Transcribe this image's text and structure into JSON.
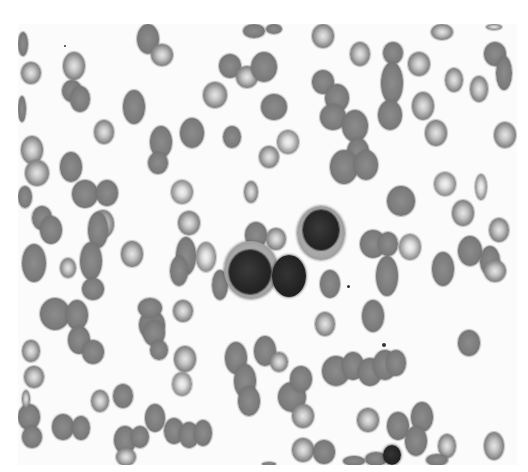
{
  "image": {
    "description": "Grayscale micrograph of a peripheral blood smear showing numerous red blood cells and a cluster of three nucleated white cells in the center",
    "field": {
      "x": 18,
      "y": 24,
      "width": 499,
      "height": 441
    },
    "colors": {
      "background": "#fbfbfb",
      "rbc": "#7c7c7c",
      "nucleus": "#222222"
    }
  },
  "cells": [
    {
      "type": "rbc-dense",
      "x": 18,
      "y": 32,
      "w": 10,
      "h": 24
    },
    {
      "type": "rbc",
      "x": 21,
      "y": 62,
      "w": 20,
      "h": 22
    },
    {
      "type": "rbc",
      "x": 63,
      "y": 52,
      "w": 22,
      "h": 28
    },
    {
      "type": "rbc-dense",
      "x": 62,
      "y": 80,
      "w": 20,
      "h": 22
    },
    {
      "type": "rbc-dense",
      "x": 70,
      "y": 86,
      "w": 20,
      "h": 26
    },
    {
      "type": "rbc-dense",
      "x": 18,
      "y": 96,
      "w": 8,
      "h": 26
    },
    {
      "type": "rbc-dense",
      "x": 123,
      "y": 90,
      "w": 22,
      "h": 34
    },
    {
      "type": "rbc",
      "x": 94,
      "y": 120,
      "w": 20,
      "h": 24
    },
    {
      "type": "rbc-dense",
      "x": 137,
      "y": 24,
      "w": 22,
      "h": 30
    },
    {
      "type": "rbc",
      "x": 151,
      "y": 44,
      "w": 22,
      "h": 22
    },
    {
      "type": "rbc",
      "x": 203,
      "y": 82,
      "w": 24,
      "h": 26
    },
    {
      "type": "rbc-dense",
      "x": 219,
      "y": 54,
      "w": 22,
      "h": 24
    },
    {
      "type": "rbc",
      "x": 236,
      "y": 66,
      "w": 22,
      "h": 22
    },
    {
      "type": "rbc-dense",
      "x": 251,
      "y": 52,
      "w": 26,
      "h": 30
    },
    {
      "type": "rbc-dense",
      "x": 261,
      "y": 94,
      "w": 26,
      "h": 26
    },
    {
      "type": "rbc-dense",
      "x": 243,
      "y": 24,
      "w": 22,
      "h": 14
    },
    {
      "type": "rbc-dense",
      "x": 266,
      "y": 24,
      "w": 16,
      "h": 10
    },
    {
      "type": "rbc-dense",
      "x": 223,
      "y": 126,
      "w": 18,
      "h": 22
    },
    {
      "type": "rbc-pale",
      "x": 277,
      "y": 130,
      "w": 22,
      "h": 24
    },
    {
      "type": "rbc",
      "x": 259,
      "y": 146,
      "w": 20,
      "h": 22
    },
    {
      "type": "rbc-dense",
      "x": 150,
      "y": 126,
      "w": 22,
      "h": 32
    },
    {
      "type": "rbc-dense",
      "x": 180,
      "y": 118,
      "w": 24,
      "h": 30
    },
    {
      "type": "rbc-dense",
      "x": 148,
      "y": 152,
      "w": 20,
      "h": 22
    },
    {
      "type": "rbc",
      "x": 312,
      "y": 24,
      "w": 22,
      "h": 24
    },
    {
      "type": "rbc",
      "x": 350,
      "y": 42,
      "w": 20,
      "h": 24
    },
    {
      "type": "rbc-dense",
      "x": 383,
      "y": 42,
      "w": 20,
      "h": 22
    },
    {
      "type": "rbc",
      "x": 408,
      "y": 52,
      "w": 22,
      "h": 24
    },
    {
      "type": "rbc-dense",
      "x": 381,
      "y": 62,
      "w": 22,
      "h": 42
    },
    {
      "type": "rbc-dense",
      "x": 378,
      "y": 100,
      "w": 24,
      "h": 30
    },
    {
      "type": "rbc",
      "x": 412,
      "y": 92,
      "w": 22,
      "h": 28
    },
    {
      "type": "rbc",
      "x": 425,
      "y": 120,
      "w": 22,
      "h": 26
    },
    {
      "type": "rbc-dense",
      "x": 312,
      "y": 70,
      "w": 22,
      "h": 24
    },
    {
      "type": "rbc-dense",
      "x": 325,
      "y": 84,
      "w": 24,
      "h": 28
    },
    {
      "type": "rbc-dense",
      "x": 320,
      "y": 104,
      "w": 26,
      "h": 26
    },
    {
      "type": "rbc-dense",
      "x": 342,
      "y": 110,
      "w": 26,
      "h": 32
    },
    {
      "type": "rbc-dense",
      "x": 347,
      "y": 138,
      "w": 22,
      "h": 28
    },
    {
      "type": "rbc-dense",
      "x": 330,
      "y": 150,
      "w": 28,
      "h": 34
    },
    {
      "type": "rbc-dense",
      "x": 354,
      "y": 150,
      "w": 24,
      "h": 30
    },
    {
      "type": "rbc",
      "x": 445,
      "y": 68,
      "w": 18,
      "h": 24
    },
    {
      "type": "rbc-dense",
      "x": 484,
      "y": 42,
      "w": 22,
      "h": 24
    },
    {
      "type": "rbc-dense",
      "x": 496,
      "y": 56,
      "w": 16,
      "h": 34
    },
    {
      "type": "rbc",
      "x": 470,
      "y": 76,
      "w": 18,
      "h": 26
    },
    {
      "type": "rbc",
      "x": 494,
      "y": 122,
      "w": 22,
      "h": 26
    },
    {
      "type": "rbc",
      "x": 431,
      "y": 24,
      "w": 22,
      "h": 16
    },
    {
      "type": "rbc",
      "x": 486,
      "y": 24,
      "w": 16,
      "h": 6
    },
    {
      "type": "rbc",
      "x": 21,
      "y": 136,
      "w": 22,
      "h": 28
    },
    {
      "type": "rbc",
      "x": 25,
      "y": 160,
      "w": 24,
      "h": 26
    },
    {
      "type": "rbc-dense",
      "x": 60,
      "y": 152,
      "w": 22,
      "h": 30
    },
    {
      "type": "rbc-dense",
      "x": 72,
      "y": 180,
      "w": 26,
      "h": 28
    },
    {
      "type": "rbc-dense",
      "x": 96,
      "y": 180,
      "w": 22,
      "h": 26
    },
    {
      "type": "rbc",
      "x": 92,
      "y": 210,
      "w": 22,
      "h": 28
    },
    {
      "type": "rbc-dense",
      "x": 18,
      "y": 186,
      "w": 14,
      "h": 22
    },
    {
      "type": "rbc-dense",
      "x": 32,
      "y": 206,
      "w": 20,
      "h": 24
    },
    {
      "type": "rbc-dense",
      "x": 40,
      "y": 216,
      "w": 22,
      "h": 28
    },
    {
      "type": "rbc-dense",
      "x": 22,
      "y": 244,
      "w": 24,
      "h": 38
    },
    {
      "type": "rbc-dense",
      "x": 88,
      "y": 212,
      "w": 20,
      "h": 36
    },
    {
      "type": "rbc",
      "x": 60,
      "y": 258,
      "w": 16,
      "h": 20
    },
    {
      "type": "rbc-dense",
      "x": 80,
      "y": 242,
      "w": 22,
      "h": 38
    },
    {
      "type": "rbc-dense",
      "x": 82,
      "y": 278,
      "w": 22,
      "h": 22
    },
    {
      "type": "rbc",
      "x": 121,
      "y": 241,
      "w": 22,
      "h": 26
    },
    {
      "type": "rbc-pale",
      "x": 171,
      "y": 180,
      "w": 22,
      "h": 24
    },
    {
      "type": "rbc",
      "x": 178,
      "y": 211,
      "w": 22,
      "h": 24
    },
    {
      "type": "rbc-dense",
      "x": 176,
      "y": 237,
      "w": 20,
      "h": 38
    },
    {
      "type": "rbc-dense",
      "x": 170,
      "y": 256,
      "w": 18,
      "h": 30
    },
    {
      "type": "rbc-pale",
      "x": 196,
      "y": 242,
      "w": 20,
      "h": 30
    },
    {
      "type": "rbc",
      "x": 244,
      "y": 181,
      "w": 14,
      "h": 22
    },
    {
      "type": "rbc-dense",
      "x": 245,
      "y": 222,
      "w": 22,
      "h": 26
    },
    {
      "type": "rbc-dense",
      "x": 212,
      "y": 270,
      "w": 16,
      "h": 30
    },
    {
      "type": "rbc",
      "x": 266,
      "y": 228,
      "w": 20,
      "h": 22
    },
    {
      "type": "rbc-dense",
      "x": 320,
      "y": 270,
      "w": 20,
      "h": 28
    },
    {
      "type": "rbc-dense",
      "x": 387,
      "y": 186,
      "w": 28,
      "h": 30
    },
    {
      "type": "rbc-dense",
      "x": 360,
      "y": 230,
      "w": 26,
      "h": 28
    },
    {
      "type": "rbc-dense",
      "x": 378,
      "y": 232,
      "w": 20,
      "h": 24
    },
    {
      "type": "rbc-pale",
      "x": 399,
      "y": 234,
      "w": 22,
      "h": 26
    },
    {
      "type": "rbc-dense",
      "x": 376,
      "y": 256,
      "w": 22,
      "h": 40
    },
    {
      "type": "rbc-pale",
      "x": 434,
      "y": 172,
      "w": 22,
      "h": 24
    },
    {
      "type": "rbc-pale",
      "x": 475,
      "y": 174,
      "w": 12,
      "h": 26
    },
    {
      "type": "rbc",
      "x": 452,
      "y": 200,
      "w": 22,
      "h": 26
    },
    {
      "type": "rbc",
      "x": 489,
      "y": 218,
      "w": 20,
      "h": 24
    },
    {
      "type": "rbc-dense",
      "x": 458,
      "y": 236,
      "w": 24,
      "h": 30
    },
    {
      "type": "rbc-dense",
      "x": 432,
      "y": 252,
      "w": 22,
      "h": 34
    },
    {
      "type": "rbc-dense",
      "x": 480,
      "y": 246,
      "w": 20,
      "h": 30
    },
    {
      "type": "rbc",
      "x": 484,
      "y": 260,
      "w": 22,
      "h": 22
    },
    {
      "type": "rbc-dense",
      "x": 362,
      "y": 300,
      "w": 22,
      "h": 32
    },
    {
      "type": "rbc-dense",
      "x": 458,
      "y": 330,
      "w": 22,
      "h": 26
    },
    {
      "type": "rbc-dense",
      "x": 40,
      "y": 298,
      "w": 30,
      "h": 32
    },
    {
      "type": "rbc-dense",
      "x": 66,
      "y": 300,
      "w": 22,
      "h": 30
    },
    {
      "type": "rbc-dense",
      "x": 68,
      "y": 326,
      "w": 22,
      "h": 28
    },
    {
      "type": "rbc-dense",
      "x": 82,
      "y": 340,
      "w": 22,
      "h": 24
    },
    {
      "type": "rbc",
      "x": 22,
      "y": 340,
      "w": 18,
      "h": 22
    },
    {
      "type": "rbc",
      "x": 24,
      "y": 366,
      "w": 20,
      "h": 22
    },
    {
      "type": "rbc-dense",
      "x": 18,
      "y": 404,
      "w": 22,
      "h": 26
    },
    {
      "type": "rbc-dense",
      "x": 22,
      "y": 426,
      "w": 20,
      "h": 22
    },
    {
      "type": "rbc",
      "x": 91,
      "y": 390,
      "w": 18,
      "h": 22
    },
    {
      "type": "rbc-dense",
      "x": 113,
      "y": 384,
      "w": 20,
      "h": 24
    },
    {
      "type": "rbc-dense",
      "x": 52,
      "y": 414,
      "w": 22,
      "h": 26
    },
    {
      "type": "rbc-dense",
      "x": 72,
      "y": 416,
      "w": 18,
      "h": 24
    },
    {
      "type": "rbc-dense",
      "x": 114,
      "y": 426,
      "w": 22,
      "h": 28
    },
    {
      "type": "rbc-dense",
      "x": 131,
      "y": 426,
      "w": 18,
      "h": 22
    },
    {
      "type": "rbc",
      "x": 116,
      "y": 448,
      "w": 20,
      "h": 18
    },
    {
      "type": "rbc-dense",
      "x": 145,
      "y": 404,
      "w": 20,
      "h": 28
    },
    {
      "type": "rbc-dense",
      "x": 164,
      "y": 418,
      "w": 20,
      "h": 26
    },
    {
      "type": "rbc-dense",
      "x": 179,
      "y": 422,
      "w": 20,
      "h": 26
    },
    {
      "type": "rbc-dense",
      "x": 194,
      "y": 420,
      "w": 18,
      "h": 26
    },
    {
      "type": "rbc",
      "x": 174,
      "y": 346,
      "w": 22,
      "h": 26
    },
    {
      "type": "rbc-pale",
      "x": 172,
      "y": 372,
      "w": 20,
      "h": 24
    },
    {
      "type": "rbc-dense",
      "x": 139,
      "y": 310,
      "w": 26,
      "h": 30
    },
    {
      "type": "rbc-dense",
      "x": 143,
      "y": 320,
      "w": 22,
      "h": 26
    },
    {
      "type": "rbc-dense",
      "x": 150,
      "y": 340,
      "w": 18,
      "h": 20
    },
    {
      "type": "rbc-dense",
      "x": 138,
      "y": 298,
      "w": 24,
      "h": 20
    },
    {
      "type": "rbc-dense",
      "x": 225,
      "y": 342,
      "w": 22,
      "h": 32
    },
    {
      "type": "rbc-dense",
      "x": 234,
      "y": 364,
      "w": 22,
      "h": 34
    },
    {
      "type": "rbc-dense",
      "x": 238,
      "y": 386,
      "w": 22,
      "h": 30
    },
    {
      "type": "rbc-dense",
      "x": 254,
      "y": 336,
      "w": 22,
      "h": 30
    },
    {
      "type": "rbc-dense",
      "x": 278,
      "y": 382,
      "w": 28,
      "h": 30
    },
    {
      "type": "rbc-dense",
      "x": 290,
      "y": 366,
      "w": 22,
      "h": 26
    },
    {
      "type": "rbc",
      "x": 292,
      "y": 404,
      "w": 22,
      "h": 24
    },
    {
      "type": "rbc",
      "x": 315,
      "y": 312,
      "w": 20,
      "h": 24
    },
    {
      "type": "rbc-dense",
      "x": 322,
      "y": 356,
      "w": 28,
      "h": 30
    },
    {
      "type": "rbc-dense",
      "x": 342,
      "y": 352,
      "w": 22,
      "h": 28
    },
    {
      "type": "rbc-dense",
      "x": 358,
      "y": 358,
      "w": 24,
      "h": 28
    },
    {
      "type": "rbc-dense",
      "x": 373,
      "y": 350,
      "w": 24,
      "h": 30
    },
    {
      "type": "rbc-dense",
      "x": 386,
      "y": 350,
      "w": 20,
      "h": 26
    },
    {
      "type": "rbc",
      "x": 357,
      "y": 408,
      "w": 22,
      "h": 24
    },
    {
      "type": "rbc-dense",
      "x": 387,
      "y": 412,
      "w": 22,
      "h": 28
    },
    {
      "type": "rbc-dense",
      "x": 411,
      "y": 402,
      "w": 22,
      "h": 30
    },
    {
      "type": "rbc-dense",
      "x": 405,
      "y": 426,
      "w": 22,
      "h": 30
    },
    {
      "type": "rbc",
      "x": 438,
      "y": 434,
      "w": 18,
      "h": 24
    },
    {
      "type": "rbc",
      "x": 484,
      "y": 432,
      "w": 20,
      "h": 28
    },
    {
      "type": "rbc",
      "x": 292,
      "y": 438,
      "w": 22,
      "h": 24
    },
    {
      "type": "rbc-dense",
      "x": 313,
      "y": 440,
      "w": 22,
      "h": 24
    },
    {
      "type": "rbc-dense",
      "x": 343,
      "y": 456,
      "w": 22,
      "h": 10
    },
    {
      "type": "rbc-dense",
      "x": 365,
      "y": 452,
      "w": 22,
      "h": 14
    },
    {
      "type": "rbc-dense",
      "x": 426,
      "y": 454,
      "w": 22,
      "h": 12
    },
    {
      "type": "rbc-dense",
      "x": 262,
      "y": 462,
      "w": 14,
      "h": 4
    },
    {
      "type": "rbc",
      "x": 22,
      "y": 390,
      "w": 8,
      "h": 18
    },
    {
      "type": "rbc",
      "x": 173,
      "y": 300,
      "w": 20,
      "h": 22
    },
    {
      "type": "rbc",
      "x": 270,
      "y": 352,
      "w": 18,
      "h": 20
    }
  ],
  "white_cells": [
    {
      "type": "large",
      "cyto": {
        "x": 224,
        "y": 241,
        "w": 54,
        "h": 58
      },
      "nucleus": {
        "x": 229,
        "y": 250,
        "w": 42,
        "h": 44
      }
    },
    {
      "type": "lymphocyte",
      "x": 272,
      "y": 255,
      "w": 34,
      "h": 42
    },
    {
      "type": "large",
      "cyto": {
        "x": 297,
        "y": 206,
        "w": 48,
        "h": 54
      },
      "nucleus": {
        "x": 303,
        "y": 210,
        "w": 36,
        "h": 40
      }
    },
    {
      "type": "small-dark",
      "x": 383,
      "y": 445,
      "w": 18,
      "h": 20
    }
  ],
  "dots": [
    {
      "x": 347,
      "y": 285,
      "s": 3
    },
    {
      "x": 382,
      "y": 343,
      "s": 4
    },
    {
      "x": 64,
      "y": 45,
      "s": 2
    }
  ]
}
